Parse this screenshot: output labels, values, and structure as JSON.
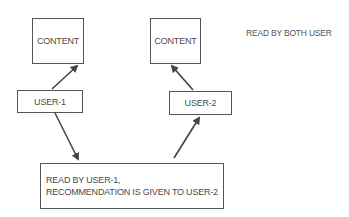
{
  "diagram": {
    "content_left": "CONTENT",
    "content_right": "CONTENT",
    "user1": "USER-1",
    "user2": "USER-2",
    "note": "READ BY BOTH USER",
    "bottom_line1": "READ BY USER-1,",
    "bottom_line2": "RECOMMENDATION IS GIVEN TO USER-2",
    "colors": {
      "stroke": "#555555",
      "text": "#4a4a4a",
      "background": "#ffffff"
    }
  }
}
